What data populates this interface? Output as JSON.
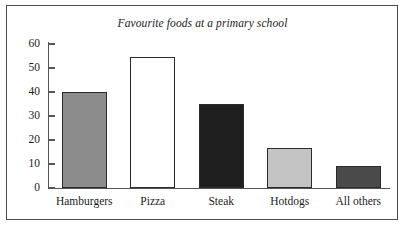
{
  "figure": {
    "frame_label": "chart-frame",
    "background_color": "#ffffff",
    "border_color": "#4c4c4c"
  },
  "axes": {
    "axis_color": "#565656",
    "y_ticks": [
      {
        "label": "0",
        "value": 0
      },
      {
        "label": "10",
        "value": 10
      },
      {
        "label": "20",
        "value": 20
      },
      {
        "label": "30",
        "value": 30
      },
      {
        "label": "40",
        "value": 40
      },
      {
        "label": "50",
        "value": 50
      },
      {
        "label": "60",
        "value": 60
      }
    ]
  },
  "chart_data": {
    "type": "bar",
    "title": "Favourite foods at a primary school",
    "xlabel": "",
    "ylabel": "",
    "ylim": [
      0,
      60
    ],
    "ytick_interval": 10,
    "grid": false,
    "legend": false,
    "categories": [
      "Hamburgers",
      "Pizza",
      "Steak",
      "Hotdogs",
      "All others"
    ],
    "values": [
      40,
      54.5,
      35,
      16.5,
      9
    ],
    "bar_colors": [
      "#8c8c8c",
      "#ffffff",
      "#1f1f1f",
      "#c4c4c4",
      "#4a4a4a"
    ],
    "bar_edge_color": "#2b2b2b",
    "bars": [
      {
        "category": "Hamburgers",
        "value": 40,
        "fill": "#8c8c8c"
      },
      {
        "category": "Pizza",
        "value": 54.5,
        "fill": "#ffffff"
      },
      {
        "category": "Steak",
        "value": 35,
        "fill": "#1f1f1f"
      },
      {
        "category": "Hotdogs",
        "value": 16.5,
        "fill": "#c4c4c4"
      },
      {
        "category": "All others",
        "value": 9,
        "fill": "#4a4a4a"
      }
    ]
  }
}
